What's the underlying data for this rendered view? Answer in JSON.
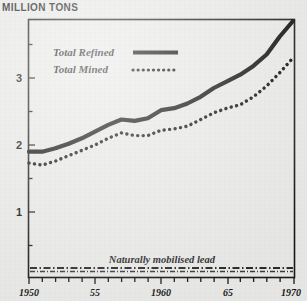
{
  "header": {
    "axis_title": "MILLION TONS"
  },
  "legend": {
    "position": "top-left-inside",
    "entries": [
      {
        "label": "Total Refined",
        "style": "solid"
      },
      {
        "label": "Total Mined",
        "style": "dotted"
      }
    ]
  },
  "annotations": [
    {
      "name": "naturally-mobilised-lead",
      "text": "Naturally mobilised lead"
    }
  ],
  "axes": {
    "y": {
      "label": "MILLION TONS",
      "ticks": [
        "1",
        "2",
        "3"
      ],
      "tick_values": [
        1,
        2,
        3
      ],
      "range": [
        0,
        3.9
      ],
      "minor_ticks": [
        0.5,
        1.5,
        2.5,
        3.5
      ]
    },
    "x": {
      "ticks": [
        "1950",
        "55",
        "1960",
        "65",
        "1970"
      ],
      "tick_values": [
        1950,
        1955,
        1960,
        1965,
        1970
      ],
      "range": [
        1950,
        1970
      ]
    }
  },
  "chart_data": {
    "type": "line",
    "title": "MILLION TONS",
    "xlabel": "",
    "ylabel": "MILLION TONS",
    "xlim": [
      1950,
      1970
    ],
    "ylim": [
      0,
      3.9
    ],
    "grid": false,
    "legend_position": "top-left-inside",
    "x": [
      1950,
      1951,
      1952,
      1953,
      1954,
      1955,
      1956,
      1957,
      1958,
      1959,
      1960,
      1961,
      1962,
      1963,
      1964,
      1965,
      1966,
      1967,
      1968,
      1969,
      1970
    ],
    "series": [
      {
        "name": "Total Refined",
        "style": "solid",
        "color": "#111111",
        "values": [
          1.9,
          1.9,
          1.95,
          2.02,
          2.1,
          2.2,
          2.3,
          2.38,
          2.36,
          2.4,
          2.52,
          2.55,
          2.62,
          2.72,
          2.85,
          2.95,
          3.05,
          3.18,
          3.35,
          3.62,
          3.85
        ]
      },
      {
        "name": "Total Mined",
        "style": "dotted",
        "color": "#111111",
        "values": [
          1.73,
          1.7,
          1.76,
          1.84,
          1.92,
          2.0,
          2.1,
          2.18,
          2.14,
          2.14,
          2.22,
          2.24,
          2.28,
          2.38,
          2.48,
          2.55,
          2.6,
          2.72,
          2.88,
          3.08,
          3.3
        ]
      }
    ],
    "band": {
      "name": "Naturally mobilised lead",
      "style": "dash-dot",
      "level": 0.18
    }
  },
  "colors": {
    "paper": "#ececeb",
    "ink": "#111111",
    "frame": "#1a1a1a"
  }
}
